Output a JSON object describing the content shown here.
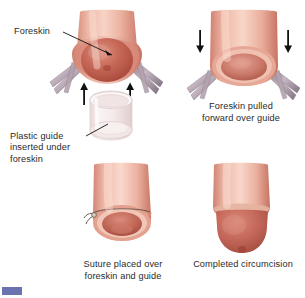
{
  "figure": {
    "background_color": "#ffffff",
    "text_color": "#2b2b2b"
  },
  "labels": [
    {
      "id": "foreskin",
      "text": "Foreskin",
      "leader": "line-from-text-to-foreskin"
    },
    {
      "id": "plastic-guide",
      "text": "Plastic guide\ninserted under\nforeskin",
      "leader": "line-from-text-to-guide-ring"
    }
  ],
  "captions": [
    {
      "id": "step-2",
      "text": "Foreskin pulled\nforward over guide"
    },
    {
      "id": "step-3",
      "text": "Suture placed over\nforeskin and guide"
    },
    {
      "id": "step-4",
      "text": "Completed circumcision"
    }
  ],
  "panels": [
    {
      "id": "step-1",
      "name": "foreskin-retracted-with-guide",
      "elements": [
        "shaft",
        "retracted-foreskin",
        "glans",
        "hemostat-clamp-left",
        "hemostat-clamp-right",
        "arrow-up-left",
        "arrow-up-right",
        "plastic-guide-ring"
      ]
    },
    {
      "id": "step-2",
      "name": "foreskin-pulled-over-guide",
      "elements": [
        "shaft",
        "foreskin-opening",
        "hemostat-clamp-left",
        "hemostat-clamp-right",
        "arrow-down-left",
        "arrow-down-right"
      ]
    },
    {
      "id": "step-3",
      "name": "suture-over-foreskin-and-guide",
      "elements": [
        "shaft",
        "foreskin-opening",
        "suture-knot"
      ]
    },
    {
      "id": "step-4",
      "name": "completed-circumcision",
      "elements": [
        "shaft",
        "exposed-glans",
        "coronal-ridge"
      ]
    }
  ],
  "colors": {
    "skin_light": "#f2c3b4",
    "skin_mid": "#e39e8d",
    "skin_dark": "#c8705f",
    "glans": "#c2584c",
    "glans_light": "#d98272",
    "inner_mucosa": "#d98a7a",
    "clamp_gray": "#a89aa6",
    "clamp_dark": "#7d6f7e",
    "guide_plastic": "#f3e7e8",
    "guide_edge": "#ddc9cc",
    "arrow": "#1a1a1a",
    "leader_line": "#1a1a1a",
    "corner_mark": "#6b72b0"
  },
  "corner_mark": {
    "name": "page-corner-mark",
    "color": "#6b72b0"
  }
}
